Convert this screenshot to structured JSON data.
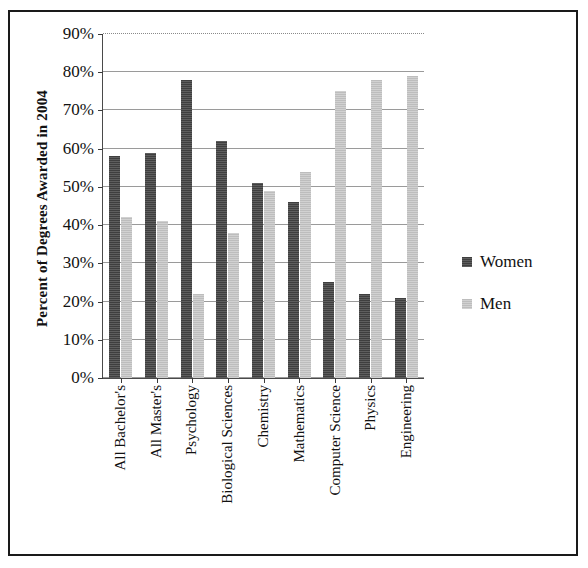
{
  "chart_data": {
    "type": "bar",
    "title": "",
    "subtitle": "",
    "xlabel": "",
    "ylabel": "Percent of Degrees Awarded in 2004",
    "ylim": [
      0,
      90
    ],
    "ytick_step": 10,
    "ytick_labels": [
      "0%",
      "10%",
      "20%",
      "30%",
      "40%",
      "50%",
      "60%",
      "70%",
      "80%",
      "90%"
    ],
    "ytick_values": [
      0,
      10,
      20,
      30,
      40,
      50,
      60,
      70,
      80,
      90
    ],
    "grid": true,
    "legend_position": "right",
    "categories": [
      "All Bachelor's",
      "All Master's",
      "Psychology",
      "Biological Sciences",
      "Chemistry",
      "Mathematics",
      "Computer Science",
      "Physics",
      "Engineering"
    ],
    "series": [
      {
        "name": "Women",
        "color": "#3f3f3f",
        "values": [
          58,
          59,
          78,
          62,
          51,
          46,
          25,
          22,
          21
        ]
      },
      {
        "name": "Men",
        "color": "#bdbdbd",
        "values": [
          42,
          41,
          22,
          38,
          49,
          54,
          75,
          78,
          79
        ]
      }
    ]
  },
  "legend": {
    "entries": [
      {
        "label": "Women",
        "swatch": "women"
      },
      {
        "label": "Men",
        "swatch": "men"
      }
    ]
  },
  "colors": {
    "women_bar": "#3f3f3f",
    "men_bar": "#bdbdbd",
    "frame_border": "#1a1a1a",
    "gridline": "#9a9a9a",
    "axis": "#4a4a4a",
    "text": "#111111",
    "background": "#ffffff"
  }
}
